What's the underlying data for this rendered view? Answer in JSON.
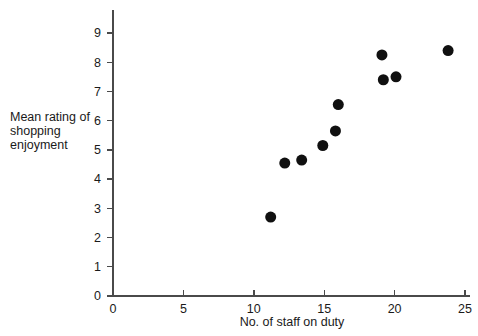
{
  "chart_data": {
    "type": "scatter",
    "title": "",
    "xlabel": "No. of staff on duty",
    "ylabel": "Mean rating of shopping enjoyment",
    "ylabel_lines": [
      "Mean rating of",
      "shopping",
      "enjoyment"
    ],
    "xlim": [
      0,
      25
    ],
    "ylim": [
      0,
      9.4
    ],
    "xticks": [
      0,
      5,
      10,
      15,
      20,
      25
    ],
    "yticks": [
      0,
      1,
      2,
      3,
      4,
      5,
      6,
      7,
      8,
      9
    ],
    "xtick_labels": [
      "0",
      "5",
      "10",
      "15",
      "20",
      "25"
    ],
    "ytick_labels": [
      "0",
      "1",
      "2",
      "3",
      "4",
      "5",
      "6",
      "7",
      "8",
      "9"
    ],
    "grid": false,
    "legend": null,
    "marker": "circle",
    "marker_color": "#101010",
    "marker_size": 11,
    "points": [
      {
        "x": 11.2,
        "y": 2.7
      },
      {
        "x": 12.2,
        "y": 4.55
      },
      {
        "x": 13.4,
        "y": 4.65
      },
      {
        "x": 14.9,
        "y": 5.15
      },
      {
        "x": 15.8,
        "y": 5.65
      },
      {
        "x": 16.0,
        "y": 6.55
      },
      {
        "x": 19.1,
        "y": 8.25
      },
      {
        "x": 19.2,
        "y": 7.4
      },
      {
        "x": 20.1,
        "y": 7.5
      },
      {
        "x": 23.8,
        "y": 8.4
      }
    ]
  },
  "colors": {
    "background": "#ffffff",
    "axis": "#4a4a4a",
    "text": "#1a1a1a",
    "marker": "#101010"
  }
}
